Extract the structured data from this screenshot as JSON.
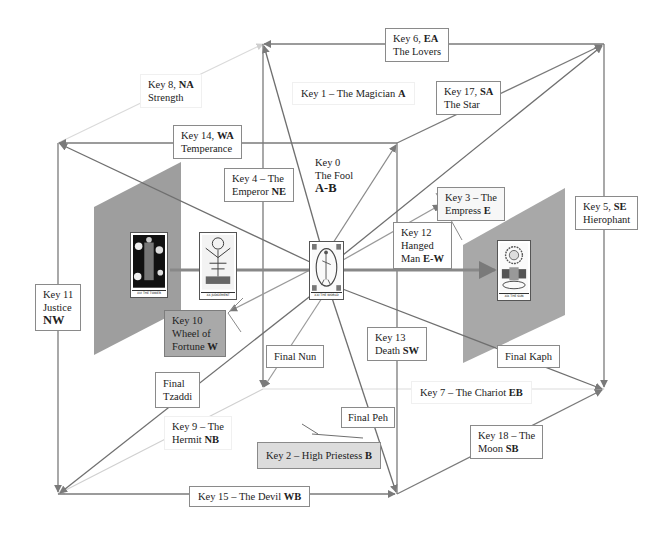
{
  "colors": {
    "line": "#7a7a7a",
    "faint_line": "#d4d4d4",
    "panel": "#9e9e9e",
    "grey_box": "#a9a9a9",
    "light_grey_box": "#dcdcdc"
  },
  "labels": {
    "key8": {
      "line1_prefix": "Key 8, ",
      "line1_bold": "NA",
      "line2": "Strength"
    },
    "key6": {
      "line1_prefix": "Key 6, ",
      "line1_bold": "EA",
      "line2": "The Lovers"
    },
    "key1": {
      "prefix": "Key 1 – The Magician ",
      "bold": "A"
    },
    "key17": {
      "line1_prefix": "Key 17, ",
      "line1_bold": "SA",
      "line2": "The Star"
    },
    "key14": {
      "line1_prefix": "Key 14, ",
      "line1_bold": "WA",
      "line2": "Temperance"
    },
    "key0": {
      "line1": "Key 0",
      "line2": "The Fool",
      "line3": "A-B"
    },
    "key4": {
      "line1": "Key 4 – The",
      "line2_prefix": "Emperor ",
      "line2_bold": "NE"
    },
    "key3": {
      "line1": "Key 3 – The",
      "line2_prefix": "Empress ",
      "line2_bold": "E"
    },
    "key5": {
      "line1_prefix": "Key 5, ",
      "line1_bold": "SE",
      "line2": "Hierophant"
    },
    "key12": {
      "line1": "Key 12",
      "line2": "Hanged",
      "line3_prefix": "Man ",
      "line3_bold": "E-W"
    },
    "key11": {
      "line1": "Key 11",
      "line2": "Justice",
      "line3": "NW"
    },
    "key10": {
      "line1": "Key 10",
      "line2": "Wheel of",
      "line3_prefix": "Fortune ",
      "line3_bold": "W"
    },
    "key13": {
      "line1": "Key 13",
      "line2_prefix": "Death ",
      "line2_bold": "SW"
    },
    "final_nun": "Final Nun",
    "final_kaph": "Final Kaph",
    "final_tzaddi": {
      "line1": "Final",
      "line2": "Tzaddi"
    },
    "key7": {
      "prefix": "Key 7 – The Chariot ",
      "bold": "EB"
    },
    "final_peh": "Final Peh",
    "key9": {
      "line1": "Key 9 – The",
      "line2_prefix": "Hermit ",
      "line2_bold": "NB"
    },
    "key18": {
      "line1": "Key 18 – The",
      "line2_prefix": "Moon ",
      "line2_bold": "SB"
    },
    "key2": {
      "prefix": "Key 2 – High Priestess ",
      "bold": "B"
    },
    "key15": {
      "prefix": "Key 15 – The Devil ",
      "bold": "WB"
    }
  },
  "cards": {
    "tower": {
      "caption": "XVI THE TOWER"
    },
    "judgement": {
      "caption": "XX JUDGEMENT"
    },
    "world": {
      "caption": "XXI THE WORLD"
    },
    "sun": {
      "caption": "XIX THE SUN"
    }
  }
}
